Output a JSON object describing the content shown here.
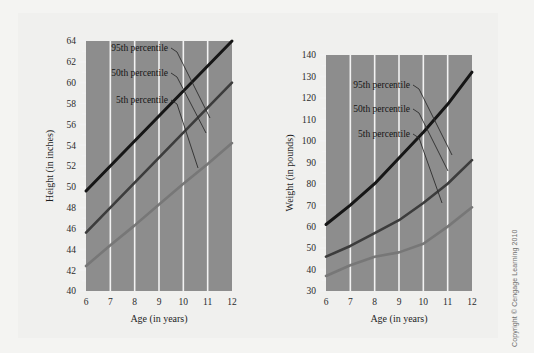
{
  "figure": {
    "background_color": "#f0f0ee",
    "plot_background_color": "#8d8d8d",
    "gridline_color": "#f2f2f2",
    "copyright": "Copyright © Cengage Learning 2010"
  },
  "series_styles": {
    "p95_color": "#161616",
    "p50_color": "#3c3c3c",
    "p5_color": "#777777",
    "leader_color": "#2d2d2d"
  },
  "chart_data": [
    {
      "type": "line",
      "id": "height-chart",
      "title": "",
      "xlabel": "Age (in years)",
      "ylabel": "Height (in inches)",
      "x": [
        6,
        7,
        8,
        9,
        10,
        11,
        12
      ],
      "xlim": [
        6,
        12
      ],
      "ylim": [
        40,
        64
      ],
      "xticks": [
        "6",
        "7",
        "8",
        "9",
        "10",
        "11",
        "12"
      ],
      "yticks": [
        "40",
        "42",
        "44",
        "46",
        "48",
        "50",
        "52",
        "54",
        "56",
        "58",
        "60",
        "62",
        "64"
      ],
      "ytick_step": 2,
      "minor_ticks": true,
      "grid": "vertical",
      "legend": "inline-labels",
      "series": [
        {
          "name": "95th percentile",
          "values": [
            49.6,
            52.0,
            54.4,
            56.8,
            59.2,
            61.6,
            64.0
          ]
        },
        {
          "name": "50th percentile",
          "values": [
            45.6,
            48.0,
            50.4,
            52.8,
            55.2,
            57.6,
            60.0
          ]
        },
        {
          "name": "5th percentile",
          "values": [
            42.4,
            44.4,
            46.3,
            48.3,
            50.3,
            52.2,
            54.2
          ]
        }
      ]
    },
    {
      "type": "line",
      "id": "weight-chart",
      "title": "",
      "xlabel": "Age (in years)",
      "ylabel": "Weight (in pounds)",
      "x": [
        6,
        7,
        8,
        9,
        10,
        11,
        12
      ],
      "xlim": [
        6,
        12
      ],
      "ylim": [
        30,
        140
      ],
      "xticks": [
        "6",
        "7",
        "8",
        "9",
        "10",
        "11",
        "12"
      ],
      "yticks": [
        "30",
        "40",
        "50",
        "60",
        "70",
        "80",
        "90",
        "100",
        "110",
        "120",
        "130",
        "140"
      ],
      "ytick_step": 10,
      "minor_ticks": true,
      "grid": "vertical",
      "legend": "inline-labels",
      "series": [
        {
          "name": "95th percentile",
          "values": [
            61,
            70,
            80,
            92,
            104,
            117,
            132
          ]
        },
        {
          "name": "50th percentile",
          "values": [
            46,
            51,
            57,
            63,
            71,
            80,
            91
          ]
        },
        {
          "name": "5th percentile",
          "values": [
            37,
            42,
            46,
            48,
            52,
            60,
            69
          ]
        }
      ]
    }
  ],
  "annotations": {
    "labels": [
      "95th percentile",
      "50th percentile",
      "5th percentile"
    ]
  }
}
